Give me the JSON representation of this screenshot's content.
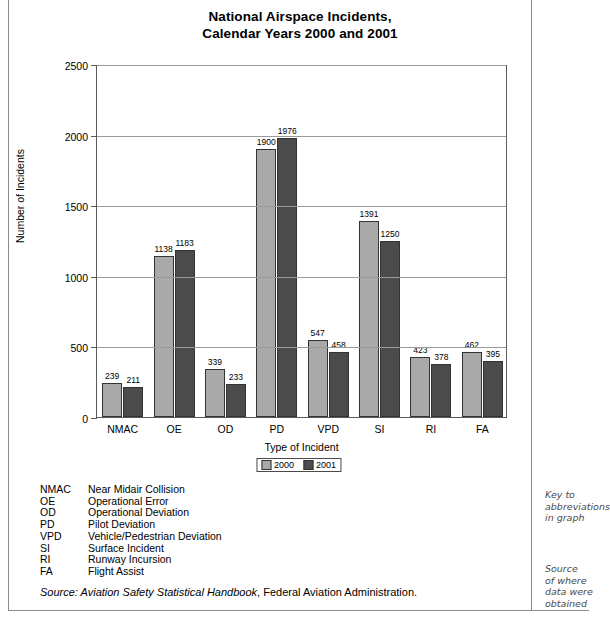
{
  "chart_data": {
    "type": "bar",
    "title": "National Airspace Incidents, Calendar Years 2000 and 2001",
    "title_line1": "National Airspace Incidents,",
    "title_line2": "Calendar Years 2000 and 2001",
    "xlabel": "Type of Incident",
    "ylabel": "Number of Incidents",
    "ylim": [
      0,
      2500
    ],
    "yticks": [
      0,
      500,
      1000,
      1500,
      2000,
      2500
    ],
    "ytick_labels": [
      "0",
      "500",
      "1000",
      "1500",
      "2000",
      "2500"
    ],
    "grid": true,
    "legend_position": "bottom-center",
    "categories": [
      "NMAC",
      "OE",
      "OD",
      "PD",
      "VPD",
      "SI",
      "RI",
      "FA"
    ],
    "series": [
      {
        "name": "2000",
        "color": "#a9a9a9",
        "values": [
          239,
          1138,
          339,
          1900,
          547,
          1391,
          423,
          462
        ]
      },
      {
        "name": "2001",
        "color": "#4b4b4b",
        "values": [
          211,
          1183,
          233,
          1976,
          458,
          1250,
          378,
          395
        ]
      }
    ]
  },
  "key": {
    "rows": [
      {
        "abbr": "NMAC",
        "desc": "Near Midair Collision"
      },
      {
        "abbr": "OE",
        "desc": "Operational Error"
      },
      {
        "abbr": "OD",
        "desc": "Operational Deviation"
      },
      {
        "abbr": "PD",
        "desc": "Pilot Deviation"
      },
      {
        "abbr": "VPD",
        "desc": "Vehicle/Pedestrian Deviation"
      },
      {
        "abbr": "SI",
        "desc": "Surface Incident"
      },
      {
        "abbr": "RI",
        "desc": "Runway Incursion"
      },
      {
        "abbr": "FA",
        "desc": "Flight Assist"
      }
    ]
  },
  "source": {
    "prefix": "Source: Aviation Safety Statistical Handbook",
    "suffix": ", Federal Aviation Administration."
  },
  "notes": {
    "key_note": "Key to\nabbreviations\nin graph",
    "source_note": "Source\nof where\ndata were\nobtained"
  }
}
